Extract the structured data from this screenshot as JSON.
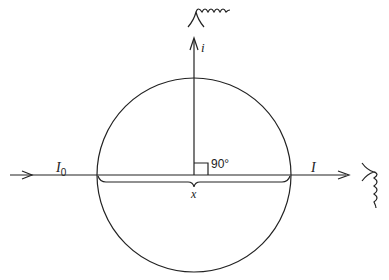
{
  "diagram": {
    "labels": {
      "incident_intensity": "I",
      "incident_subscript": "0",
      "transmitted_intensity": "I",
      "scattered_intensity": "i",
      "angle": "90°",
      "path_length": "x"
    },
    "elements": [
      {
        "name": "incident-beam",
        "from": [
          10,
          175
        ],
        "to": [
          97,
          175
        ],
        "label": "I0"
      },
      {
        "name": "sphere",
        "shape": "circle",
        "center": [
          194,
          175
        ],
        "radius": 97
      },
      {
        "name": "transmitted-beam",
        "from": [
          291,
          175
        ],
        "to": [
          348,
          175
        ],
        "label": "I"
      },
      {
        "name": "scattered-beam",
        "from": [
          194,
          175
        ],
        "to": [
          194,
          40
        ],
        "label": "i"
      },
      {
        "name": "right-angle-marker",
        "angle_deg": 90
      },
      {
        "name": "path-brace",
        "span": [
          97,
          291
        ],
        "label": "x"
      },
      {
        "name": "detector-top",
        "type": "eye-with-nerve"
      },
      {
        "name": "detector-right",
        "type": "eye-with-nerve"
      }
    ],
    "colors": {
      "stroke": "#222222",
      "background": "#ffffff"
    }
  }
}
